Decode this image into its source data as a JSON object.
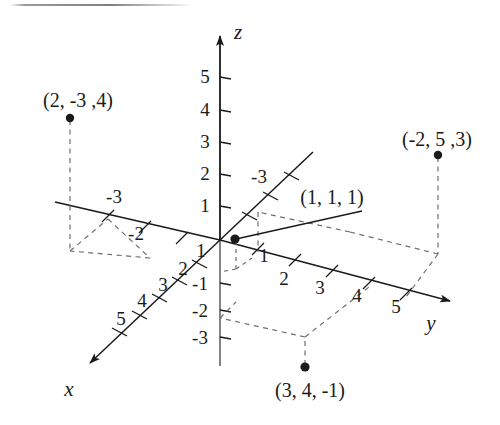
{
  "figure": {
    "kind": "3d-cartesian-coordinate-diagram",
    "width": 500,
    "height": 425,
    "background": "#ffffff",
    "ink_color": "#1a1a1a",
    "dash_color": "#6e6e6e"
  },
  "axes": {
    "x": {
      "label": "x",
      "label_pos": [
        69,
        389
      ],
      "origin": [
        220,
        240
      ],
      "positive_dir_tip": [
        82,
        370
      ],
      "negative_dir_tip": [
        313,
        152
      ],
      "positive_ticks": [
        {
          "value": "1",
          "label_pos": [
            201,
            250
          ],
          "tick_pos": [
            200,
            263
          ]
        },
        {
          "value": "2",
          "label_pos": [
            183,
            268
          ],
          "tick_pos": [
            180,
            280
          ]
        },
        {
          "value": "3",
          "label_pos": [
            163,
            283
          ],
          "tick_pos": [
            160,
            297
          ]
        },
        {
          "value": "4",
          "label_pos": [
            141,
            299
          ],
          "tick_pos": [
            140,
            314
          ]
        },
        {
          "value": "5",
          "label_pos": [
            121,
            317
          ],
          "tick_pos": [
            120,
            331
          ]
        }
      ],
      "negative_ticks": [
        {
          "value": "-3",
          "label_pos": [
            257,
            176
          ],
          "tick_pos": [
            281,
            188
          ]
        }
      ]
    },
    "y": {
      "label": "y",
      "label_pos": [
        431,
        323
      ],
      "origin": [
        220,
        240
      ],
      "positive_dir_tip": [
        456,
        302
      ],
      "negative_dir_tip": [
        55,
        202
      ],
      "positive_ticks": [
        {
          "value": "1",
          "label_pos": [
            264,
            255
          ],
          "tick_pos": [
            258,
            252
          ]
        },
        {
          "value": "2",
          "label_pos": [
            284,
            278
          ],
          "tick_pos": [
            295,
            263
          ]
        },
        {
          "value": "3",
          "label_pos": [
            320,
            286
          ],
          "tick_pos": [
            332,
            275
          ]
        },
        {
          "value": "4",
          "label_pos": [
            357,
            294
          ],
          "tick_pos": [
            369,
            286
          ]
        },
        {
          "value": "5",
          "label_pos": [
            396,
            305
          ],
          "tick_pos": [
            406,
            297
          ]
        }
      ],
      "negative_ticks": [
        {
          "value": "-3",
          "label_pos": [
            112,
            196
          ],
          "tick_pos": [
            108,
            218
          ]
        },
        {
          "value": "-2",
          "label_pos": [
            134,
            232
          ],
          "tick_pos": [
            145,
            229
          ]
        }
      ]
    },
    "z": {
      "label": "z",
      "label_pos": [
        238,
        32
      ],
      "origin": [
        220,
        240
      ],
      "positive_dir_tip": [
        220,
        28
      ],
      "negative_end": [
        220,
        366
      ],
      "positive_ticks": [
        {
          "value": "1",
          "label_pos": [
            205,
            205
          ],
          "tick_y": 206
        },
        {
          "value": "2",
          "label_pos": [
            205,
            173
          ],
          "tick_y": 174
        },
        {
          "value": "3",
          "label_pos": [
            205,
            141
          ],
          "tick_y": 142
        },
        {
          "value": "4",
          "label_pos": [
            205,
            109
          ],
          "tick_y": 110
        },
        {
          "value": "5",
          "label_pos": [
            205,
            76
          ],
          "tick_y": 77
        }
      ],
      "negative_ticks": [
        {
          "value": "-1",
          "label_pos": [
            200,
            283
          ],
          "tick_y": 283
        },
        {
          "value": "-2",
          "label_pos": [
            200,
            310
          ],
          "tick_y": 310
        },
        {
          "value": "-3",
          "label_pos": [
            200,
            337
          ],
          "tick_y": 337
        }
      ]
    }
  },
  "points": [
    {
      "name": "point-2-neg3-4",
      "label": "(2, -3 ,4)",
      "coords": [
        2,
        -3,
        4
      ],
      "label_pos": [
        78,
        100
      ],
      "dot_pos": [
        70,
        118
      ],
      "foot_pos": [
        70,
        251
      ]
    },
    {
      "name": "point-neg2-5-3",
      "label": "(-2, 5 ,3)",
      "coords": [
        -2,
        5,
        3
      ],
      "label_pos": [
        437,
        139
      ],
      "dot_pos": [
        438,
        155
      ],
      "foot_pos": [
        438,
        254
      ]
    },
    {
      "name": "point-1-1-1",
      "label": "(1, 1, 1)",
      "coords": [
        1,
        1,
        1
      ],
      "label_pos": [
        332,
        197
      ],
      "dot_pos": [
        235,
        239
      ],
      "leader_end": [
        362,
        210
      ]
    },
    {
      "name": "point-3-4-neg1",
      "label": "(3, 4, -1)",
      "coords": [
        3,
        4,
        -1
      ],
      "label_pos": [
        310,
        390
      ],
      "dot_pos": [
        305,
        367
      ],
      "foot_pos": [
        305,
        337
      ]
    }
  ],
  "artifacts": {
    "top_scanline": {
      "x": 10,
      "y": 4,
      "width": 182
    }
  }
}
